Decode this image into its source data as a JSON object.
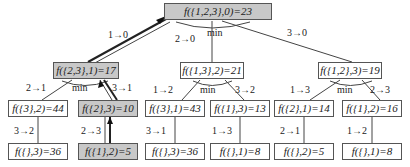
{
  "diagram": {
    "type": "tree",
    "highlight_color": "#c8c8c8",
    "nodes": {
      "root": "f({1,2,3},0)=23",
      "n1": "f({2,3},1)=17",
      "n2": "f({1,3},2)=21",
      "n3": "f({1,2},3)=19",
      "n11": "f({3},2)=44",
      "n12": "f({2},3)=10",
      "n21": "f({3},1)=43",
      "n22": "f({1},3)=13",
      "n31": "f({2},1)=14",
      "n32": "f({1},2)=16",
      "n111": "f({},3)=36",
      "n121": "f({1},2)=5",
      "n211": "f({},3)=36",
      "n221": "f({},1)=8",
      "n311": "f({},2)=5",
      "n321": "f({},1)=8"
    },
    "edge_labels": {
      "root_n1": "1→0",
      "root_n2": "2→0",
      "root_n3": "3→0",
      "n1_n11": "2→1",
      "n1_n12": "3→1",
      "n2_n21": "1→2",
      "n2_n22": "3→2",
      "n3_n31": "1→3",
      "n3_n32": "2→3",
      "n11_n111": "3→2",
      "n12_n121": "2→3",
      "n21_n211": "3→1",
      "n22_n221": "1→3",
      "n31_n311": "2→1",
      "n32_n321": "1→2"
    },
    "min_label": "min",
    "optimal_path": [
      "n121",
      "n12",
      "n1",
      "root"
    ]
  }
}
